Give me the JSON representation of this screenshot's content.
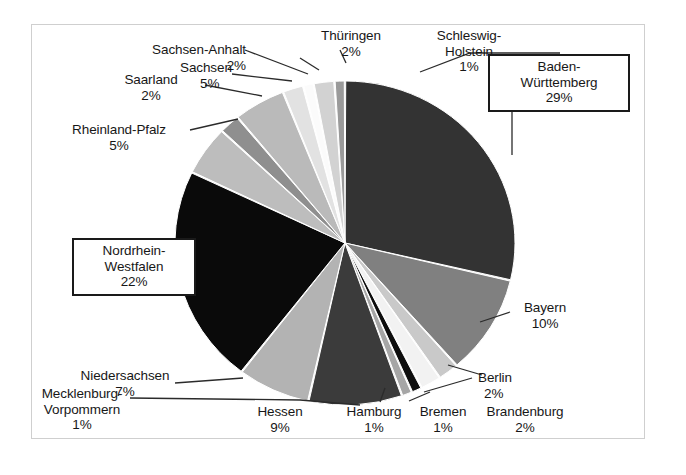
{
  "chart_data": {
    "type": "pie",
    "title": "",
    "subtitle": "",
    "xlabel": "",
    "ylabel": "",
    "legend_position": "none",
    "grid": false,
    "value_unit": "%",
    "start_angle_deg": 0,
    "direction": "clockwise",
    "categories": [
      "Baden-Württemberg",
      "Bayern",
      "Berlin",
      "Brandenburg",
      "Bremen",
      "Hamburg",
      "Hessen",
      "Niedersachsen",
      "Nordrhein-Westfalen",
      "Rheinland-Pfalz",
      "Saarland",
      "Sachsen",
      "Sachsen-Anhalt",
      "Schleswig-Holstein",
      "Thüringen",
      "Mecklenburg-Vorpommern"
    ],
    "values": [
      29,
      10,
      2,
      2,
      1,
      1,
      9,
      7,
      22,
      5,
      2,
      5,
      2,
      1,
      2,
      1
    ],
    "colors": [
      "#333333",
      "#808080",
      "#c9c9c9",
      "#f2f2f2",
      "#0d0d0d",
      "#a6a6a6",
      "#3b3b3b",
      "#b3b3b3",
      "#0a0a0a",
      "#bdbdbd",
      "#8f8f8f",
      "#bababa",
      "#e2e2e2",
      "#fbfbfb",
      "#d2d2d2",
      "#9a9a9a"
    ],
    "slices": [
      {
        "label": "Baden-Württemberg",
        "value": 29,
        "display": "29%",
        "color": "#333333"
      },
      {
        "label": "Bayern",
        "value": 10,
        "display": "10%",
        "color": "#808080"
      },
      {
        "label": "Berlin",
        "value": 2,
        "display": "2%",
        "color": "#c9c9c9"
      },
      {
        "label": "Brandenburg",
        "value": 2,
        "display": "2%",
        "color": "#f2f2f2"
      },
      {
        "label": "Bremen",
        "value": 1,
        "display": "1%",
        "color": "#0d0d0d"
      },
      {
        "label": "Hamburg",
        "value": 1,
        "display": "1%",
        "color": "#a6a6a6"
      },
      {
        "label": "Hessen",
        "value": 9,
        "display": "9%",
        "color": "#3b3b3b"
      },
      {
        "label": "Niedersachsen",
        "value": 7,
        "display": "7%",
        "color": "#b3b3b3"
      },
      {
        "label": "Nordrhein-Westfalen",
        "value": 22,
        "display": "22%",
        "color": "#0a0a0a"
      },
      {
        "label": "Rheinland-Pfalz",
        "value": 5,
        "display": "5%",
        "color": "#bdbdbd"
      },
      {
        "label": "Saarland",
        "value": 2,
        "display": "2%",
        "color": "#8f8f8f"
      },
      {
        "label": "Sachsen",
        "value": 5,
        "display": "5%",
        "color": "#bababa"
      },
      {
        "label": "Sachsen-Anhalt",
        "value": 2,
        "display": "2%",
        "color": "#e2e2e2"
      },
      {
        "label": "Schleswig-Holstein",
        "value": 1,
        "display": "1%",
        "color": "#fbfbfb"
      },
      {
        "label": "Thüringen",
        "value": 2,
        "display": "2%",
        "color": "#d2d2d2"
      },
      {
        "label": "Mecklenburg-Vorpommern",
        "value": 1,
        "display": "1%",
        "color": "#9a9a9a"
      }
    ]
  },
  "labels": {
    "baden_wuerttemberg": {
      "line1": "Baden-",
      "line2": "Württemberg",
      "pct": "29%",
      "boxed": true
    },
    "bayern": {
      "line1": "Bayern",
      "pct": "10%",
      "boxed": false
    },
    "berlin": {
      "line1": "Berlin",
      "pct": "2%",
      "boxed": false
    },
    "brandenburg": {
      "line1": "Brandenburg",
      "pct": "2%",
      "boxed": false
    },
    "bremen": {
      "line1": "Bremen",
      "pct": "1%",
      "boxed": false
    },
    "hamburg": {
      "line1": "Hamburg",
      "pct": "1%",
      "boxed": false
    },
    "hessen": {
      "line1": "Hessen",
      "pct": "9%",
      "boxed": false
    },
    "niedersachsen": {
      "line1": "Niedersachsen",
      "pct": "7%",
      "boxed": false
    },
    "nordrhein_westfalen": {
      "line1": "Nordrhein-",
      "line2": "Westfalen",
      "pct": "22%",
      "boxed": true
    },
    "rheinland_pfalz": {
      "line1": "Rheinland-Pfalz",
      "pct": "5%",
      "boxed": false
    },
    "saarland": {
      "line1": "Saarland",
      "pct": "2%",
      "boxed": false
    },
    "sachsen": {
      "line1": "Sachsen",
      "pct": "5%",
      "boxed": false
    },
    "sachsen_anhalt": {
      "line1": "Sachsen-Anhalt",
      "pct": "2%",
      "boxed": false
    },
    "schleswig_holstein": {
      "line1": "Schleswig-",
      "line2": "Holstein",
      "pct": "1%",
      "boxed": false
    },
    "thueringen": {
      "line1": "Thüringen",
      "pct": "2%",
      "boxed": false
    },
    "mecklenburg_vorpommern": {
      "line1": "Mecklenburg-",
      "line2": "Vorpommern",
      "pct": "1%",
      "boxed": false
    }
  },
  "style": {
    "border_color": "#cfcfcf",
    "text_color": "#171717",
    "background": "#ffffff",
    "leader_color": "#2b2b2b"
  }
}
